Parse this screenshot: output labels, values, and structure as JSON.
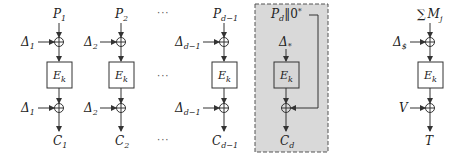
{
  "diagram": {
    "type": "block-cipher-mode",
    "colors": {
      "line": "#333333",
      "highlight_fill": "#d9d9d9",
      "highlight_border": "#555555",
      "box_fill": "#d6d6d6"
    },
    "columns": [
      {
        "id": "c1",
        "input": "P",
        "input_sub": "1",
        "mask_in": "Δ",
        "mask_in_sub": "1",
        "cipher": "E",
        "cipher_sub": "k",
        "mask_out": "Δ",
        "mask_out_sub": "1",
        "output": "C",
        "output_sub": "1"
      },
      {
        "id": "c2",
        "input": "P",
        "input_sub": "2",
        "mask_in": "Δ",
        "mask_in_sub": "2",
        "cipher": "E",
        "cipher_sub": "k",
        "mask_out": "Δ",
        "mask_out_sub": "2",
        "output": "C",
        "output_sub": "2"
      },
      {
        "id": "cd1",
        "input": "P",
        "input_sub": "d−1",
        "mask_in": "Δ",
        "mask_in_sub": "d−1",
        "cipher": "E",
        "cipher_sub": "k",
        "mask_out": "Δ",
        "mask_out_sub": "d−1",
        "output": "C",
        "output_sub": "d−1"
      }
    ],
    "ellipsis": "···",
    "last_block": {
      "input": "P",
      "input_sub": "d",
      "input_suffix": "‖0",
      "input_sup": "*",
      "mask": "Δ",
      "mask_sub": "*",
      "cipher": "E",
      "cipher_sub": "k",
      "output": "C",
      "output_sub": "d"
    },
    "tag_block": {
      "input_sym": "∑",
      "input": "M",
      "input_sub": "j",
      "mask": "Δ",
      "mask_sub": "$",
      "cipher": "E",
      "cipher_sub": "k",
      "mask_out": "V",
      "output": "T"
    }
  }
}
